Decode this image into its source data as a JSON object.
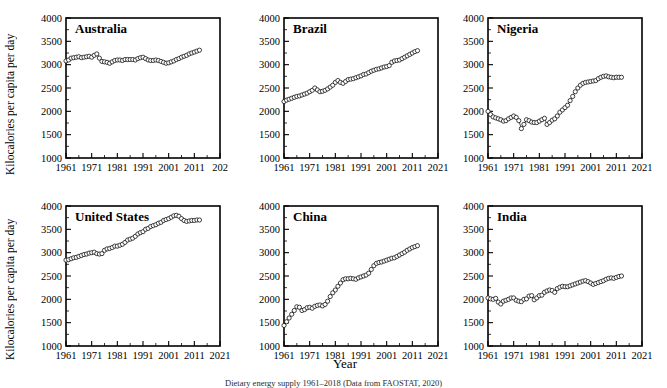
{
  "figure": {
    "ylabel": "Kilocalories per capita per day",
    "xlabel": "Year",
    "caption": "Dietary energy supply 1961–2018 (Data from FAOSTAT, 2020)"
  },
  "axes": {
    "ylim": [
      1000,
      4000
    ],
    "yticks": [
      1000,
      1500,
      2000,
      2500,
      3000,
      3500,
      4000
    ],
    "ytick_labels": [
      "1000",
      "1500",
      "2000",
      "2500",
      "3000",
      "3500",
      "4000"
    ],
    "xlim": [
      1961,
      2021
    ],
    "xticks": [
      1961,
      1971,
      1981,
      1991,
      2001,
      2011,
      2021
    ],
    "xtick_labels": [
      "1961",
      "1971",
      "1981",
      "1991",
      "2001",
      "2011",
      "2021"
    ],
    "xtick_labels_australia": [
      "1961",
      "1971",
      "1981",
      "1991",
      "2001",
      "2011",
      "202"
    ],
    "grid": false,
    "marker": "open-circle"
  },
  "chart_data": [
    {
      "type": "line",
      "title": "Australia",
      "xlabel": "Year",
      "ylabel": "Kilocalories per capita per day",
      "xlim": [
        1961,
        2021
      ],
      "ylim": [
        1000,
        4000
      ],
      "grid": false,
      "x": [
        1961,
        1962,
        1963,
        1964,
        1965,
        1966,
        1967,
        1968,
        1969,
        1970,
        1971,
        1972,
        1973,
        1974,
        1975,
        1976,
        1977,
        1978,
        1979,
        1980,
        1981,
        1982,
        1983,
        1984,
        1985,
        1986,
        1987,
        1988,
        1989,
        1990,
        1991,
        1992,
        1993,
        1994,
        1995,
        1996,
        1997,
        1998,
        1999,
        2000,
        2001,
        2002,
        2003,
        2004,
        2005,
        2006,
        2007,
        2008,
        2009,
        2010,
        2011,
        2012,
        2013
      ],
      "values": [
        3080,
        3100,
        3140,
        3150,
        3160,
        3170,
        3150,
        3160,
        3170,
        3180,
        3160,
        3200,
        3230,
        3140,
        3070,
        3060,
        3050,
        3030,
        3060,
        3090,
        3100,
        3100,
        3090,
        3110,
        3110,
        3110,
        3110,
        3100,
        3130,
        3150,
        3160,
        3130,
        3100,
        3090,
        3090,
        3100,
        3090,
        3070,
        3050,
        3030,
        3040,
        3060,
        3080,
        3110,
        3130,
        3160,
        3180,
        3200,
        3230,
        3250,
        3270,
        3290,
        3310
      ]
    },
    {
      "type": "line",
      "title": "Brazil",
      "xlabel": "Year",
      "ylabel": "Kilocalories per capita per day",
      "xlim": [
        1961,
        2021
      ],
      "ylim": [
        1000,
        4000
      ],
      "grid": false,
      "x": [
        1961,
        1962,
        1963,
        1964,
        1965,
        1966,
        1967,
        1968,
        1969,
        1970,
        1971,
        1972,
        1973,
        1974,
        1975,
        1976,
        1977,
        1978,
        1979,
        1980,
        1981,
        1982,
        1983,
        1984,
        1985,
        1986,
        1987,
        1988,
        1989,
        1990,
        1991,
        1992,
        1993,
        1994,
        1995,
        1996,
        1997,
        1998,
        1999,
        2000,
        2001,
        2002,
        2003,
        2004,
        2005,
        2006,
        2007,
        2008,
        2009,
        2010,
        2011,
        2012,
        2013
      ],
      "values": [
        2210,
        2240,
        2260,
        2280,
        2300,
        2320,
        2330,
        2350,
        2370,
        2390,
        2420,
        2450,
        2500,
        2460,
        2420,
        2430,
        2450,
        2480,
        2520,
        2560,
        2620,
        2660,
        2620,
        2600,
        2640,
        2680,
        2690,
        2700,
        2720,
        2740,
        2760,
        2790,
        2800,
        2830,
        2860,
        2880,
        2900,
        2910,
        2930,
        2950,
        2960,
        2980,
        3050,
        3080,
        3090,
        3100,
        3130,
        3160,
        3190,
        3220,
        3250,
        3280,
        3300
      ]
    },
    {
      "type": "line",
      "title": "Nigeria",
      "xlabel": "Year",
      "ylabel": "Kilocalories per capita per day",
      "xlim": [
        1961,
        2021
      ],
      "ylim": [
        1000,
        4000
      ],
      "grid": false,
      "x": [
        1961,
        1962,
        1963,
        1964,
        1965,
        1966,
        1967,
        1968,
        1969,
        1970,
        1971,
        1972,
        1973,
        1974,
        1975,
        1976,
        1977,
        1978,
        1979,
        1980,
        1981,
        1982,
        1983,
        1984,
        1985,
        1986,
        1987,
        1988,
        1989,
        1990,
        1991,
        1992,
        1993,
        1994,
        1995,
        1996,
        1997,
        1998,
        1999,
        2000,
        2001,
        2002,
        2003,
        2004,
        2005,
        2006,
        2007,
        2008,
        2009,
        2010,
        2011,
        2012,
        2013
      ],
      "values": [
        2000,
        1930,
        1880,
        1860,
        1840,
        1820,
        1790,
        1800,
        1840,
        1870,
        1900,
        1870,
        1800,
        1630,
        1720,
        1820,
        1800,
        1770,
        1760,
        1760,
        1790,
        1820,
        1850,
        1720,
        1760,
        1810,
        1840,
        1900,
        1980,
        2030,
        2080,
        2130,
        2230,
        2320,
        2420,
        2500,
        2560,
        2600,
        2620,
        2630,
        2640,
        2650,
        2660,
        2700,
        2730,
        2750,
        2760,
        2740,
        2730,
        2720,
        2730,
        2730,
        2730
      ]
    },
    {
      "type": "line",
      "title": "United States",
      "xlabel": "Year",
      "ylabel": "Kilocalories per capita per day",
      "xlim": [
        1961,
        2021
      ],
      "ylim": [
        1000,
        4000
      ],
      "grid": false,
      "x": [
        1961,
        1962,
        1963,
        1964,
        1965,
        1966,
        1967,
        1968,
        1969,
        1970,
        1971,
        1972,
        1973,
        1974,
        1975,
        1976,
        1977,
        1978,
        1979,
        1980,
        1981,
        1982,
        1983,
        1984,
        1985,
        1986,
        1987,
        1988,
        1989,
        1990,
        1991,
        1992,
        1993,
        1994,
        1995,
        1996,
        1997,
        1998,
        1999,
        2000,
        2001,
        2002,
        2003,
        2004,
        2005,
        2006,
        2007,
        2008,
        2009,
        2010,
        2011,
        2012,
        2013
      ],
      "values": [
        2840,
        2850,
        2870,
        2890,
        2900,
        2920,
        2940,
        2960,
        2970,
        2990,
        3000,
        3010,
        2980,
        2970,
        2980,
        3050,
        3080,
        3090,
        3110,
        3140,
        3140,
        3160,
        3180,
        3220,
        3270,
        3290,
        3310,
        3350,
        3400,
        3430,
        3450,
        3500,
        3520,
        3560,
        3580,
        3600,
        3630,
        3650,
        3690,
        3710,
        3730,
        3760,
        3790,
        3800,
        3780,
        3730,
        3690,
        3670,
        3680,
        3690,
        3690,
        3700,
        3700
      ]
    },
    {
      "type": "line",
      "title": "China",
      "xlabel": "Year",
      "ylabel": "Kilocalories per capita per day",
      "xlim": [
        1961,
        2021
      ],
      "ylim": [
        1000,
        4000
      ],
      "grid": false,
      "x": [
        1961,
        1962,
        1963,
        1964,
        1965,
        1966,
        1967,
        1968,
        1969,
        1970,
        1971,
        1972,
        1973,
        1974,
        1975,
        1976,
        1977,
        1978,
        1979,
        1980,
        1981,
        1982,
        1983,
        1984,
        1985,
        1986,
        1987,
        1988,
        1989,
        1990,
        1991,
        1992,
        1993,
        1994,
        1995,
        1996,
        1997,
        1998,
        1999,
        2000,
        2001,
        2002,
        2003,
        2004,
        2005,
        2006,
        2007,
        2008,
        2009,
        2010,
        2011,
        2012,
        2013
      ],
      "values": [
        1440,
        1520,
        1600,
        1680,
        1760,
        1840,
        1830,
        1760,
        1780,
        1820,
        1830,
        1810,
        1850,
        1870,
        1880,
        1860,
        1890,
        1960,
        2060,
        2140,
        2200,
        2280,
        2350,
        2420,
        2440,
        2440,
        2450,
        2440,
        2430,
        2460,
        2480,
        2500,
        2520,
        2560,
        2640,
        2720,
        2770,
        2790,
        2800,
        2820,
        2840,
        2860,
        2880,
        2890,
        2920,
        2950,
        2980,
        3010,
        3050,
        3080,
        3110,
        3130,
        3150
      ]
    },
    {
      "type": "line",
      "title": "India",
      "xlabel": "Year",
      "ylabel": "Kilocalories per capita per day",
      "xlim": [
        1961,
        2021
      ],
      "ylim": [
        1000,
        4000
      ],
      "grid": false,
      "x": [
        1961,
        1962,
        1963,
        1964,
        1965,
        1966,
        1967,
        1968,
        1969,
        1970,
        1971,
        1972,
        1973,
        1974,
        1975,
        1976,
        1977,
        1978,
        1979,
        1980,
        1981,
        1982,
        1983,
        1984,
        1985,
        1986,
        1987,
        1988,
        1989,
        1990,
        1991,
        1992,
        1993,
        1994,
        1995,
        1996,
        1997,
        1998,
        1999,
        2000,
        2001,
        2002,
        2003,
        2004,
        2005,
        2006,
        2007,
        2008,
        2009,
        2010,
        2011,
        2012,
        2013
      ],
      "values": [
        2030,
        2010,
        2000,
        2020,
        1940,
        1900,
        1960,
        1980,
        2000,
        2030,
        2030,
        1980,
        1960,
        1950,
        2000,
        2010,
        2070,
        2080,
        1990,
        2030,
        2080,
        2090,
        2150,
        2180,
        2200,
        2190,
        2150,
        2230,
        2260,
        2280,
        2270,
        2270,
        2290,
        2310,
        2330,
        2350,
        2370,
        2390,
        2400,
        2380,
        2350,
        2320,
        2340,
        2360,
        2380,
        2400,
        2430,
        2450,
        2460,
        2450,
        2470,
        2490,
        2500
      ]
    }
  ]
}
